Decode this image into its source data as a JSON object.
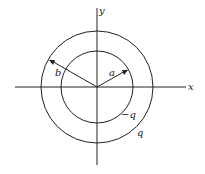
{
  "diagram": {
    "type": "concentric-spheres-cross-section",
    "center": [
      97,
      87
    ],
    "inner_circle": {
      "radius_px": 36,
      "radius_label": "a",
      "charge_label": "−q"
    },
    "outer_circle": {
      "radius_px": 56,
      "radius_label": "b",
      "charge_label": "q"
    },
    "axes": {
      "x_label": "x",
      "y_label": "y"
    },
    "stroke_color": "#222222",
    "background": "#ffffff"
  }
}
